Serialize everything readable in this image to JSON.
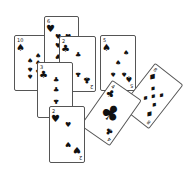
{
  "scene": {
    "description": "Scattered spread of eight playing cards on white background",
    "background": "#ffffff",
    "ink_color": "#111111"
  },
  "cards": [
    {
      "id": "ten-spades",
      "rank": "10",
      "suit": "spades",
      "symbol": "♠"
    },
    {
      "id": "six-hearts",
      "rank": "6",
      "suit": "hearts",
      "symbol": "♥"
    },
    {
      "id": "two-clubs",
      "rank": "2",
      "suit": "clubs",
      "symbol": "♣"
    },
    {
      "id": "five-spades",
      "rank": "5",
      "suit": "spades",
      "symbol": "♠"
    },
    {
      "id": "three-clubs",
      "rank": "3",
      "suit": "clubs",
      "symbol": "♣"
    },
    {
      "id": "eight-diamonds",
      "rank": "8",
      "suit": "diamonds",
      "symbol": "♦"
    },
    {
      "id": "four-clubs",
      "rank": "4",
      "suit": "clubs",
      "symbol": "♣"
    },
    {
      "id": "two-hearts",
      "rank": "2",
      "suit": "hearts",
      "symbol": "♥"
    }
  ]
}
